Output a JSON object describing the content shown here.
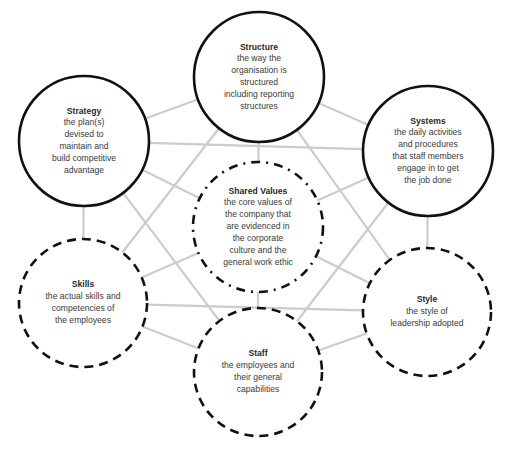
{
  "colors": {
    "connector": "#cccccc",
    "circle_stroke": "#111111",
    "text": "#3a3a3a",
    "background": "#ffffff"
  },
  "nodes": [
    {
      "id": "structure",
      "title": "Structure",
      "description": "the way the\norganisation is\nstructured\nincluding reporting\nstructures",
      "border": "solid",
      "cx": 259,
      "cy": 77,
      "r": 65
    },
    {
      "id": "strategy",
      "title": "Strategy",
      "description": "the plan(s)\ndevised to\nmaintain and\nbuild competitive\nadvantage",
      "border": "solid",
      "cx": 84,
      "cy": 141,
      "r": 65
    },
    {
      "id": "systems",
      "title": "Systems",
      "description": "the daily activities\nand procedures\nthat staff members\nengage in to get\nthe job done",
      "border": "solid",
      "cx": 428,
      "cy": 151,
      "r": 65
    },
    {
      "id": "shared-values",
      "title": "Shared Values",
      "description": "the core values of\nthe company that\nare evidenced in\nthe corporate\nculture and the\ngeneral work ethic",
      "border": "dash-dot",
      "cx": 258,
      "cy": 227,
      "r": 65
    },
    {
      "id": "skills",
      "title": "Skills",
      "description": "the actual skills and\ncompetencies of\nthe employees",
      "border": "dashed",
      "cx": 83,
      "cy": 303,
      "r": 64
    },
    {
      "id": "style",
      "title": "Style",
      "description": "the style of\nleadership adopted",
      "border": "dashed",
      "cx": 427,
      "cy": 312,
      "r": 64
    },
    {
      "id": "staff",
      "title": "Staff",
      "description": "the employees and\ntheir general\ncapabilities",
      "border": "dashed",
      "cx": 258,
      "cy": 372,
      "r": 64
    }
  ],
  "connections": [
    [
      "structure",
      "strategy"
    ],
    [
      "structure",
      "systems"
    ],
    [
      "structure",
      "shared-values"
    ],
    [
      "structure",
      "skills"
    ],
    [
      "structure",
      "style"
    ],
    [
      "strategy",
      "systems"
    ],
    [
      "strategy",
      "shared-values"
    ],
    [
      "strategy",
      "skills"
    ],
    [
      "strategy",
      "staff"
    ],
    [
      "systems",
      "shared-values"
    ],
    [
      "systems",
      "style"
    ],
    [
      "systems",
      "staff"
    ],
    [
      "shared-values",
      "skills"
    ],
    [
      "shared-values",
      "style"
    ],
    [
      "shared-values",
      "staff"
    ],
    [
      "skills",
      "style"
    ],
    [
      "skills",
      "staff"
    ],
    [
      "style",
      "staff"
    ]
  ]
}
